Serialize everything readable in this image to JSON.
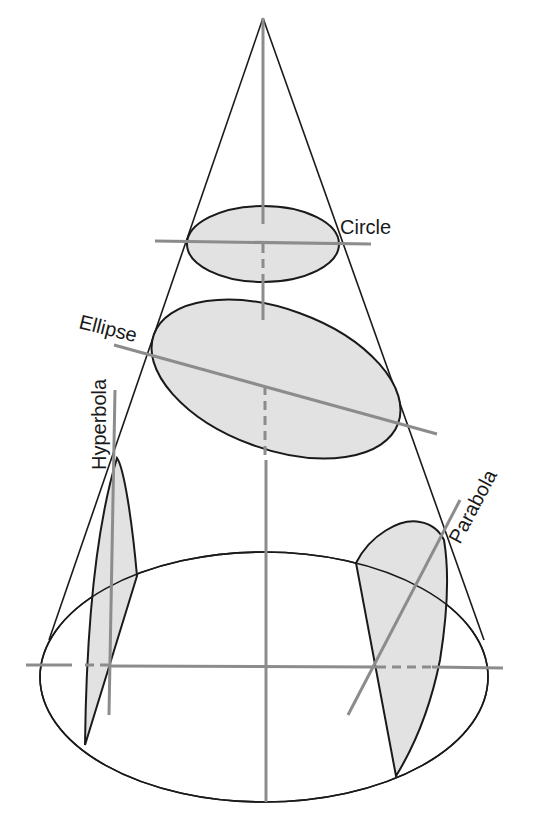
{
  "figure": {
    "labels": {
      "circle": "Circle",
      "ellipse": "Ellipse",
      "hyperbola": "Hyperbola",
      "parabola": "Parabola"
    },
    "colors": {
      "outline": "#1a1a1a",
      "section_fill": "#e2e2e2",
      "axis": "#8c8c8c",
      "background": "#ffffff"
    }
  }
}
